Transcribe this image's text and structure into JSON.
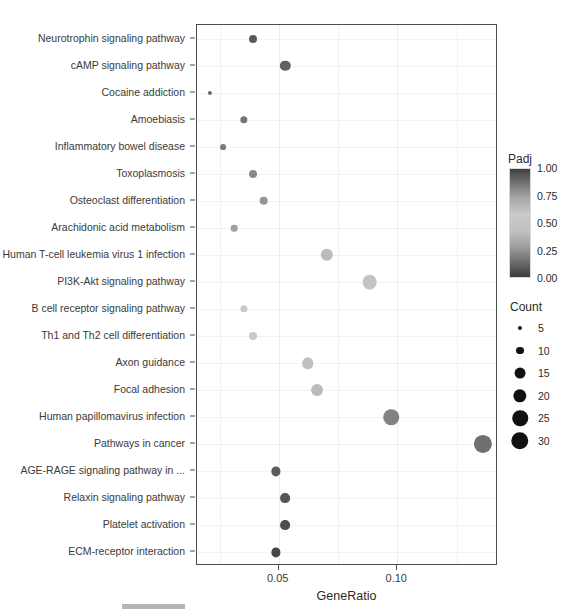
{
  "chart_data": {
    "type": "scatter",
    "title": "",
    "xlabel": "GeneRatio",
    "ylabel": "",
    "xlim": [
      0.0155,
      0.1425
    ],
    "xticks": [
      0.05,
      0.1
    ],
    "xticklabels": [
      "0.05",
      "0.10"
    ],
    "grid": true,
    "legend_position": "right",
    "categories": [
      "Neurotrophin signaling pathway",
      "cAMP signaling pathway",
      "Cocaine addiction",
      "Amoebiasis",
      "Inflammatory bowel disease",
      "Toxoplasmosis",
      "Osteoclast differentiation",
      "Arachidonic acid metabolism",
      "Human T-cell leukemia virus 1 infection",
      "PI3K-Akt signaling pathway",
      "B cell receptor signaling pathway",
      "Th1 and Th2 cell differentiation",
      "Axon guidance",
      "Focal adhesion",
      "Human papillomavirus infection",
      "Pathways in cancer",
      "AGE-RAGE signaling pathway in ...",
      "Relaxin signaling pathway",
      "Platelet activation",
      "ECM-receptor interaction"
    ],
    "series": [
      {
        "name": "pathways",
        "x_name": "GeneRatio",
        "size_name": "Count",
        "color_name": "Padj",
        "points": [
          {
            "label": "Neurotrophin signaling pathway",
            "gene_ratio": 0.039,
            "count": 10,
            "padj": 0.9
          },
          {
            "label": "cAMP signaling pathway",
            "gene_ratio": 0.0528,
            "count": 14,
            "padj": 0.88
          },
          {
            "label": "Cocaine addiction",
            "gene_ratio": 0.021,
            "count": 5,
            "padj": 0.86
          },
          {
            "label": "Amoebiasis",
            "gene_ratio": 0.0353,
            "count": 9,
            "padj": 0.82
          },
          {
            "label": "Inflammatory bowel disease",
            "gene_ratio": 0.0265,
            "count": 7,
            "padj": 0.8
          },
          {
            "label": "Toxoplasmosis",
            "gene_ratio": 0.039,
            "count": 10,
            "padj": 0.76
          },
          {
            "label": "Osteoclast differentiation",
            "gene_ratio": 0.0437,
            "count": 11,
            "padj": 0.72
          },
          {
            "label": "Arachidonic acid metabolism",
            "gene_ratio": 0.0311,
            "count": 8,
            "padj": 0.68
          },
          {
            "label": "Human T-cell leukemia virus 1 infection",
            "gene_ratio": 0.0702,
            "count": 18,
            "padj": 0.58
          },
          {
            "label": "PI3K-Akt signaling pathway",
            "gene_ratio": 0.0883,
            "count": 23,
            "padj": 0.55
          },
          {
            "label": "B cell receptor signaling pathway",
            "gene_ratio": 0.0353,
            "count": 9,
            "padj": 0.52
          },
          {
            "label": "Th1 and Th2 cell differentiation",
            "gene_ratio": 0.039,
            "count": 10,
            "padj": 0.48
          },
          {
            "label": "Axon guidance",
            "gene_ratio": 0.0622,
            "count": 16,
            "padj": 0.44
          },
          {
            "label": "Focal adhesion",
            "gene_ratio": 0.066,
            "count": 17,
            "padj": 0.42
          },
          {
            "label": "Human papillomavirus infection",
            "gene_ratio": 0.0975,
            "count": 25,
            "padj": 0.22
          },
          {
            "label": "Pathways in cancer",
            "gene_ratio": 0.1362,
            "count": 32,
            "padj": 0.16
          },
          {
            "label": "AGE-RAGE signaling pathway in ...",
            "gene_ratio": 0.0487,
            "count": 12,
            "padj": 0.1
          },
          {
            "label": "Relaxin signaling pathway",
            "gene_ratio": 0.0525,
            "count": 13,
            "padj": 0.08
          },
          {
            "label": "Platelet activation",
            "gene_ratio": 0.0525,
            "count": 13,
            "padj": 0.06
          },
          {
            "label": "ECM-receptor interaction",
            "gene_ratio": 0.0487,
            "count": 12,
            "padj": 0.04
          }
        ]
      }
    ],
    "legends": {
      "color": {
        "title": "Padj",
        "ticks": [
          "1.00",
          "0.75",
          "0.50",
          "0.25",
          "0.00"
        ],
        "tick_values": [
          1.0,
          0.75,
          0.5,
          0.25,
          0.0
        ],
        "high_color": "#3f3f3f",
        "mid_color": "#c9c9c9",
        "low_color": "#3c3c3c"
      },
      "size": {
        "title": "Count",
        "ticks": [
          "5",
          "10",
          "15",
          "20",
          "25",
          "30"
        ],
        "tick_values": [
          5,
          10,
          15,
          20,
          25,
          30
        ],
        "marker_color": "#111111"
      }
    }
  },
  "axes": {
    "x_title": "GeneRatio",
    "x_tick_labels": [
      "0.05",
      "0.10"
    ]
  }
}
